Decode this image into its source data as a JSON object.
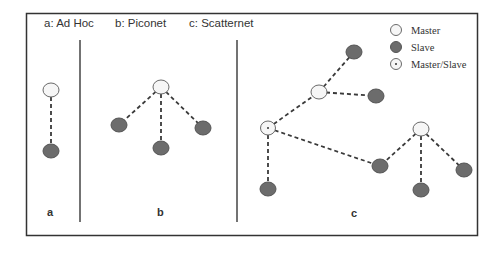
{
  "diagram": {
    "headers": {
      "a": "a: Ad Hoc",
      "b": "b: Piconet",
      "c": "c: Scatternet"
    },
    "panel_labels": {
      "a": "a",
      "b": "b",
      "c": "c"
    },
    "legend": {
      "master": "Master",
      "slave": "Slave",
      "master_slave": "Master/Slave"
    },
    "colors": {
      "master_fill": "#f6f6f6",
      "slave_fill": "#6c6c6c",
      "line": "#3a3a3a"
    },
    "panels": [
      {
        "id": "a",
        "title": "Ad Hoc",
        "nodes": [
          {
            "id": "a1",
            "type": "master",
            "x": 51,
            "y": 90
          },
          {
            "id": "a2",
            "type": "slave",
            "x": 51,
            "y": 151
          }
        ],
        "edges": [
          [
            "a1",
            "a2"
          ]
        ]
      },
      {
        "id": "b",
        "title": "Piconet",
        "nodes": [
          {
            "id": "b0",
            "type": "master",
            "x": 161,
            "y": 87
          },
          {
            "id": "b1",
            "type": "slave",
            "x": 119,
            "y": 125
          },
          {
            "id": "b2",
            "type": "slave",
            "x": 161,
            "y": 148
          },
          {
            "id": "b3",
            "type": "slave",
            "x": 203,
            "y": 128
          }
        ],
        "edges": [
          [
            "b0",
            "b1"
          ],
          [
            "b0",
            "b2"
          ],
          [
            "b0",
            "b3"
          ]
        ]
      },
      {
        "id": "c",
        "title": "Scatternet",
        "nodes": [
          {
            "id": "c_ms",
            "type": "master_slave",
            "x": 268,
            "y": 128
          },
          {
            "id": "c_m1",
            "type": "master",
            "x": 319,
            "y": 92
          },
          {
            "id": "c_s1",
            "type": "slave",
            "x": 354,
            "y": 52
          },
          {
            "id": "c_s2",
            "type": "slave",
            "x": 376,
            "y": 96
          },
          {
            "id": "c_s3",
            "type": "slave",
            "x": 268,
            "y": 189
          },
          {
            "id": "c_s4",
            "type": "slave",
            "x": 380,
            "y": 166
          },
          {
            "id": "c_m2",
            "type": "master",
            "x": 421,
            "y": 129
          },
          {
            "id": "c_s5",
            "type": "slave",
            "x": 421,
            "y": 190
          },
          {
            "id": "c_s6",
            "type": "slave",
            "x": 464,
            "y": 170
          }
        ],
        "edges": [
          [
            "c_ms",
            "c_m1"
          ],
          [
            "c_m1",
            "c_s1"
          ],
          [
            "c_m1",
            "c_s2"
          ],
          [
            "c_ms",
            "c_s3"
          ],
          [
            "c_ms",
            "c_s4"
          ],
          [
            "c_m2",
            "c_s4"
          ],
          [
            "c_m2",
            "c_s5"
          ],
          [
            "c_m2",
            "c_s6"
          ]
        ]
      }
    ]
  }
}
